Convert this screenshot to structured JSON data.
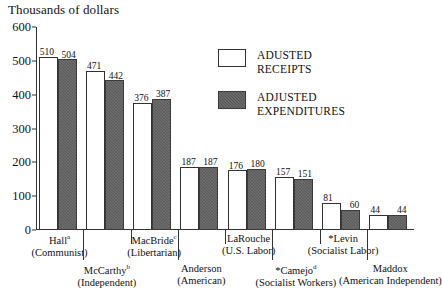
{
  "chart_data": {
    "type": "bar",
    "title": "Thousands of dollars",
    "xlabel": "",
    "ylabel": "Thousands of dollars",
    "ylim": [
      0,
      600
    ],
    "yticks": [
      0,
      100,
      200,
      300,
      400,
      500,
      600
    ],
    "grid": false,
    "legend_position": "inside-top-right",
    "categories": [
      "Hall (Communist)",
      "McCarthy (Independent)",
      "MacBride (Libertarian)",
      "Anderson (American)",
      "LaRouche (U.S. Labor)",
      "*Camejo (Socialist Workers)",
      "*Levin (Socialist Labor)",
      "Maddox (American Independent)"
    ],
    "series": [
      {
        "name": "ADUSTED RECEIPTS",
        "values": [
          510,
          471,
          376,
          187,
          176,
          157,
          81,
          44
        ]
      },
      {
        "name": "ADJUSTED EXPENDITURES",
        "values": [
          504,
          442,
          387,
          187,
          180,
          151,
          60,
          44
        ]
      }
    ]
  },
  "title": "Thousands of dollars",
  "axis": {
    "y_ticks": [
      "600",
      "500",
      "400",
      "300",
      "200",
      "100",
      "0"
    ]
  },
  "legend": {
    "receipts_line1": "ADUSTED",
    "receipts_line2": "RECEIPTS",
    "expenditures_line1": "ADJUSTED",
    "expenditures_line2": "EXPENDITURES"
  },
  "groups": [
    {
      "name": "Hall",
      "sup": "a",
      "party": "(Communist)",
      "receipts": "510",
      "expenditures": "504",
      "row": "top"
    },
    {
      "name": "McCarthy",
      "sup": "b",
      "party": "(Independent)",
      "receipts": "471",
      "expenditures": "442",
      "row": "bottom"
    },
    {
      "name": "MacBride",
      "sup": "c",
      "party": "(Libertarian)",
      "receipts": "376",
      "expenditures": "387",
      "row": "top"
    },
    {
      "name": "Anderson",
      "sup": "",
      "party": "(American)",
      "receipts": "187",
      "expenditures": "187",
      "row": "bottom"
    },
    {
      "name": "LaRouche",
      "sup": "",
      "party": "(U.S. Labor)",
      "receipts": "176",
      "expenditures": "180",
      "row": "top"
    },
    {
      "name": "*Camejo",
      "sup": "d",
      "party": "(Socialist Workers)",
      "receipts": "157",
      "expenditures": "151",
      "row": "bottom"
    },
    {
      "name": "*Levin",
      "sup": "",
      "party": "(Socialist Labor)",
      "receipts": "81",
      "expenditures": "60",
      "row": "top"
    },
    {
      "name": "Maddox",
      "sup": "",
      "party": "(American Independent)",
      "receipts": "44",
      "expenditures": "44",
      "row": "bottom"
    }
  ],
  "colors": {
    "receipts_fill": "#ffffff",
    "expenditures_fill": "#5a5a5a",
    "axis": "#333333",
    "text": "#111111"
  }
}
